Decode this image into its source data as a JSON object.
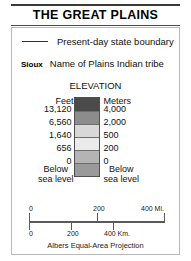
{
  "title": "THE GREAT PLAINS",
  "legend": {
    "boundary": {
      "swatch": "line-swatch",
      "label": "Present-day state boundary"
    },
    "tribe": {
      "example_name": "Sioux",
      "label": "Name of Plains Indian tribe"
    }
  },
  "elevation": {
    "heading": "ELEVATION",
    "column_headers": {
      "feet": "Feet",
      "meters": "Meters"
    },
    "ticks": [
      {
        "feet": "13,120",
        "meters": "4,000"
      },
      {
        "feet": "6,560",
        "meters": "2,000"
      },
      {
        "feet": "1,640",
        "meters": "500"
      },
      {
        "feet": "656",
        "meters": "200"
      },
      {
        "feet": "0",
        "meters": "0"
      }
    ],
    "below_sea_level": {
      "feet_line1": "Below",
      "feet_line2": "sea level",
      "meters_line1": "Below",
      "meters_line2": "sea level"
    },
    "bands": [
      {
        "name": "above-4000-m",
        "color": "#4b4b4b"
      },
      {
        "name": "2000-4000-m",
        "color": "#8c8c8c"
      },
      {
        "name": "500-2000-m",
        "color": "#d8d8d8"
      },
      {
        "name": "200-500-m",
        "color": "#ebebeb"
      },
      {
        "name": "0-200-m",
        "color": "#b4b4b4"
      },
      {
        "name": "below-sea-level",
        "color": "#9a9a9a"
      }
    ]
  },
  "scale": {
    "miles": {
      "unit_label": "400 Mi.",
      "ticks": [
        "0",
        "200"
      ]
    },
    "kilometers": {
      "unit_label": "400 Km.",
      "ticks": [
        "0",
        "200"
      ]
    },
    "projection": "Albers Equal-Area Projection"
  }
}
